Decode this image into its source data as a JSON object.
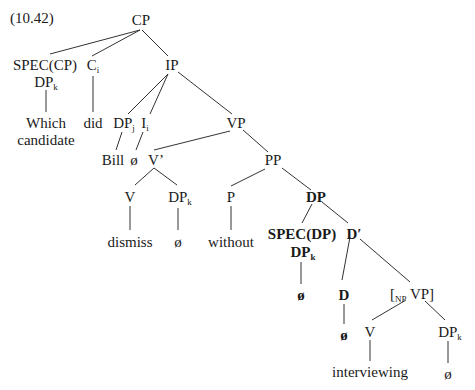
{
  "example_number": "(10.42)",
  "nodes": {
    "cp": {
      "label": "CP"
    },
    "spec_cp": {
      "label": "SPEC(CP)"
    },
    "dp_k1": {
      "label": "DP",
      "sub": "k"
    },
    "which_candidate": {
      "line1": "Which",
      "line2": "candidate"
    },
    "c": {
      "label": "C",
      "sub": "i"
    },
    "did": {
      "label": "did"
    },
    "ip": {
      "label": "IP"
    },
    "dp_j": {
      "label": "DP",
      "sub": "j"
    },
    "i": {
      "label": "I",
      "sub": "i"
    },
    "bill": {
      "label": "Bill"
    },
    "null_i": {
      "label": "ø"
    },
    "vp1": {
      "label": "VP"
    },
    "vbar": {
      "label": "V’"
    },
    "v1": {
      "label": "V"
    },
    "dismiss": {
      "label": "dismiss"
    },
    "dp_k2": {
      "label": "DP",
      "sub": "k"
    },
    "null_dp_k2": {
      "label": "ø"
    },
    "pp": {
      "label": "PP"
    },
    "p": {
      "label": "P"
    },
    "without": {
      "label": "without"
    },
    "dp": {
      "label": "DP"
    },
    "spec_dp": {
      "label": "SPEC(DP)"
    },
    "dp_k3": {
      "label": "DP",
      "sub": "k"
    },
    "null_spec_dp": {
      "label": "ø"
    },
    "dbar": {
      "label": "D′"
    },
    "d": {
      "label": "D"
    },
    "null_d": {
      "label": "ø"
    },
    "np_vp": {
      "open": "[",
      "sub": "NP",
      "label": " VP]"
    },
    "v2": {
      "label": "V"
    },
    "interviewing": {
      "label": "interviewing"
    },
    "dp_k4": {
      "label": "DP",
      "sub": "k"
    },
    "null_dp_k4": {
      "label": "ø"
    }
  }
}
